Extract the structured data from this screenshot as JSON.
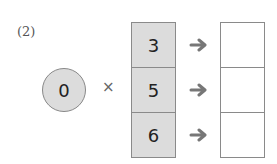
{
  "problem": {
    "label": "(2)",
    "multiplier": "0",
    "operator": "×",
    "inputs": [
      "3",
      "5",
      "6"
    ],
    "outputs": [
      "",
      "",
      ""
    ],
    "arrow_icon": "right-arrow-icon"
  },
  "colors": {
    "shaded": "#dcdcdc",
    "border": "#8a8a8a",
    "arrow": "#777777"
  }
}
